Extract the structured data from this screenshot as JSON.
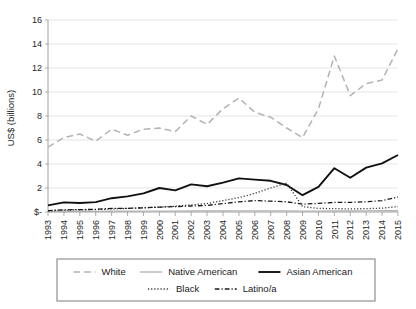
{
  "chart_data": {
    "type": "line",
    "title": "",
    "xlabel": "",
    "ylabel": "US$ (billions)",
    "ylim": [
      0,
      16
    ],
    "yticks": [
      0,
      2,
      4,
      6,
      8,
      10,
      12,
      14,
      16
    ],
    "ytick_labels": [
      "$-",
      "2",
      "4",
      "6",
      "8",
      "10",
      "12",
      "14",
      "16"
    ],
    "grid": true,
    "legend_position": "bottom",
    "x": [
      1993,
      1994,
      1995,
      1996,
      1997,
      1998,
      1999,
      2000,
      2001,
      2002,
      2003,
      2004,
      2005,
      2006,
      2007,
      2008,
      2009,
      2010,
      2011,
      2012,
      2013,
      2014,
      2015
    ],
    "categories": [
      "1993",
      "1994",
      "1995",
      "1996",
      "1997",
      "1998",
      "1999",
      "2000",
      "2001",
      "2002",
      "2003",
      "2004",
      "2005",
      "2006",
      "2007",
      "2008",
      "2009",
      "2010",
      "2011",
      "2012",
      "2013",
      "2014",
      "2015"
    ],
    "series": [
      {
        "name": "White",
        "color": "#b3b3b3",
        "style": "dashed",
        "width": 1.5,
        "values": [
          5.4,
          6.2,
          6.5,
          5.9,
          6.9,
          6.4,
          6.9,
          7.0,
          6.7,
          8.0,
          7.3,
          8.6,
          9.5,
          8.3,
          7.9,
          7.0,
          6.2,
          8.6,
          13.0,
          9.7,
          10.7,
          11.0,
          13.6
        ]
      },
      {
        "name": "Native American",
        "color": "#b3b3b3",
        "style": "solid",
        "width": 1.4,
        "values": [
          0.03,
          0.04,
          0.05,
          0.05,
          0.06,
          0.06,
          0.07,
          0.07,
          0.07,
          0.08,
          0.08,
          0.08,
          0.09,
          0.09,
          0.09,
          0.09,
          0.07,
          0.07,
          0.08,
          0.08,
          0.09,
          0.1,
          0.11
        ]
      },
      {
        "name": "Asian American",
        "color": "#111111",
        "style": "solid",
        "width": 1.9,
        "values": [
          0.55,
          0.8,
          0.75,
          0.82,
          1.15,
          1.3,
          1.55,
          2.0,
          1.8,
          2.3,
          2.15,
          2.45,
          2.8,
          2.7,
          2.6,
          2.25,
          1.4,
          2.1,
          3.65,
          2.85,
          3.7,
          4.05,
          4.75
        ]
      },
      {
        "name": "Black",
        "color": "#333333",
        "style": "dotted",
        "width": 1.3,
        "values": [
          0.1,
          0.15,
          0.18,
          0.2,
          0.25,
          0.3,
          0.35,
          0.42,
          0.48,
          0.6,
          0.7,
          0.95,
          1.2,
          1.55,
          2.0,
          2.4,
          0.45,
          0.3,
          0.28,
          0.26,
          0.28,
          0.32,
          0.45
        ]
      },
      {
        "name": "Latino/a",
        "color": "#1a1a1a",
        "style": "dashdot",
        "width": 1.3,
        "values": [
          0.12,
          0.18,
          0.2,
          0.22,
          0.3,
          0.3,
          0.35,
          0.4,
          0.45,
          0.5,
          0.55,
          0.7,
          0.85,
          0.95,
          0.9,
          0.85,
          0.65,
          0.72,
          0.8,
          0.8,
          0.85,
          0.95,
          1.25
        ]
      }
    ]
  },
  "legend": {
    "row1": [
      "White",
      "Native American",
      "Asian American"
    ],
    "row2": [
      "Black",
      "Latino/a"
    ]
  }
}
